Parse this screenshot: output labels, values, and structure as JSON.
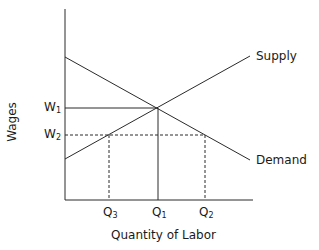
{
  "diagram": {
    "type": "supply-demand",
    "x_axis_label": "Quantity of Labor",
    "y_axis_label": "Wages",
    "curves": {
      "supply": {
        "label": "Supply",
        "from": [
          65,
          159
        ],
        "to": [
          250,
          56
        ]
      },
      "demand": {
        "label": "Demand",
        "from": [
          65,
          57
        ],
        "to": [
          250,
          160
        ]
      }
    },
    "y_ticks": [
      {
        "base": "W",
        "sub": "1",
        "y": 108
      },
      {
        "base": "W",
        "sub": "2",
        "y": 135
      }
    ],
    "x_ticks": [
      {
        "base": "Q",
        "sub": "3",
        "x": 109
      },
      {
        "base": "Q",
        "sub": "1",
        "x": 158
      },
      {
        "base": "Q",
        "sub": "2",
        "x": 205
      }
    ],
    "equilibrium": {
      "wage": "W1",
      "quantity": "Q1"
    },
    "colors": {
      "line": "#2a2a2a",
      "text": "#1a1a1a"
    }
  }
}
